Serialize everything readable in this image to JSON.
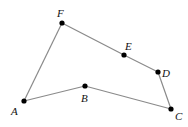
{
  "diagram": {
    "type": "polygon",
    "edge_color": "#8a8a8a",
    "point_color": "#000000",
    "points": [
      {
        "label": "A",
        "x": 24,
        "y": 101,
        "lx": 11,
        "ly": 115
      },
      {
        "label": "B",
        "x": 85,
        "y": 86,
        "lx": 81,
        "ly": 102
      },
      {
        "label": "C",
        "x": 171,
        "y": 109,
        "lx": 175,
        "ly": 120
      },
      {
        "label": "D",
        "x": 158,
        "y": 72,
        "lx": 162,
        "ly": 77
      },
      {
        "label": "E",
        "x": 124,
        "y": 55,
        "lx": 125,
        "ly": 50
      },
      {
        "label": "F",
        "x": 62,
        "y": 23,
        "lx": 57,
        "ly": 17
      }
    ],
    "edges": [
      [
        "A",
        "B"
      ],
      [
        "B",
        "C"
      ],
      [
        "C",
        "D"
      ],
      [
        "D",
        "E"
      ],
      [
        "E",
        "F"
      ],
      [
        "F",
        "A"
      ]
    ]
  }
}
